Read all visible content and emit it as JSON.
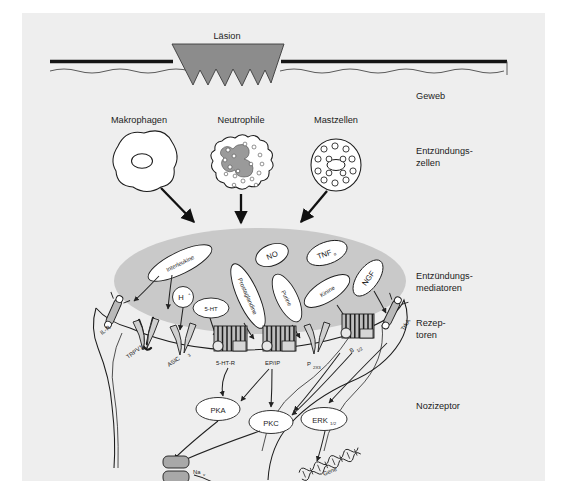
{
  "diagram": {
    "title_text": "Läsion",
    "language": "de"
  },
  "tissue": {
    "lesion_label": "Läsion",
    "tissue_label": "Geweb"
  },
  "cells": {
    "section_label_line1": "Entzündungs-",
    "section_label_line2": "zellen",
    "items": [
      {
        "label": "Makrophagen",
        "icon": "macrophage-cell-icon"
      },
      {
        "label": "Neutrophile",
        "icon": "neutrophil-cell-icon"
      },
      {
        "label": "Mastzellen",
        "icon": "mast-cell-icon"
      }
    ]
  },
  "mediators": {
    "section_label_line1": "Entzündungs-",
    "section_label_line2": "mediatoren",
    "items": [
      {
        "label": "Interleukine"
      },
      {
        "label": "H",
        "sup": "+"
      },
      {
        "label": "5-HT"
      },
      {
        "label": "Prostaglandine"
      },
      {
        "label": "NO"
      },
      {
        "label": "Purine"
      },
      {
        "label": "Kinine"
      },
      {
        "label": "TNF",
        "sub": "α"
      },
      {
        "label": "NGF"
      }
    ]
  },
  "receptors": {
    "section_label_line1": "Rezep-",
    "section_label_line2": "toren",
    "items": [
      {
        "label": "IL-R",
        "sub": ""
      },
      {
        "label": "TRPV1",
        "sub": ""
      },
      {
        "label": "ASIC",
        "sub": "3"
      },
      {
        "label": "5-HT-R",
        "sub": ""
      },
      {
        "label": "EP/IP",
        "sub": ""
      },
      {
        "label": "P",
        "sub": "2X3"
      },
      {
        "label": "B",
        "sub": "1/2"
      },
      {
        "label": "TrkA",
        "sub": ""
      }
    ]
  },
  "neuron": {
    "label": "Nozizeptor",
    "kinases": [
      {
        "label": "PKA",
        "sub": ""
      },
      {
        "label": "PKC",
        "sub": ""
      },
      {
        "label": "ERK",
        "sub": "1/2"
      }
    ],
    "channel": {
      "label": "Na",
      "sub": "v"
    },
    "gene": {
      "label": "Gene"
    }
  },
  "colors": {
    "panel_bg": "#eeeeee",
    "lesion_fill": "#8c8c8c",
    "cloud_fill": "#c9c9c9",
    "outline": "#1c1c1c",
    "channel_fill": "#a8a8a8",
    "nucleus_fill": "#9a9a9a"
  }
}
